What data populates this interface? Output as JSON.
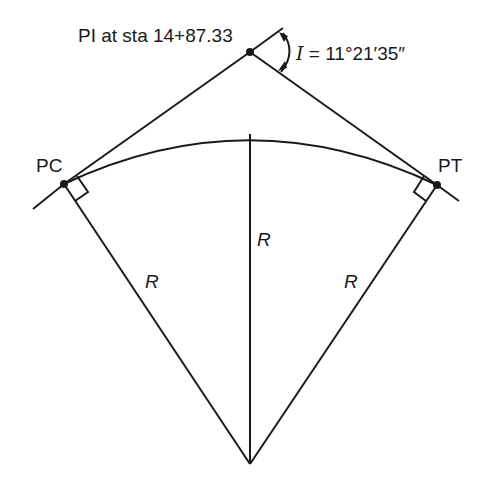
{
  "diagram": {
    "type": "horizontal circular curve",
    "labels": {
      "pi": "PI at sta 14+87.33",
      "angle_symbol": "I",
      "angle_eq": " = 11°21′35″",
      "pc": "PC",
      "pt": "PT",
      "radius_center": "R",
      "radius_left": "R",
      "radius_right": "R"
    },
    "points": {
      "PI": {
        "station": "14+87.33"
      },
      "PC": {},
      "PT": {}
    },
    "intersection_angle": "11°21′35″",
    "colors": {
      "line": "#1a1a1a",
      "background": "#ffffff"
    }
  }
}
